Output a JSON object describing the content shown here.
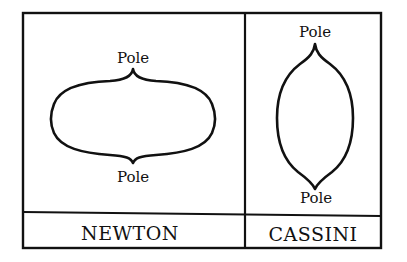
{
  "diagram": {
    "colors": {
      "ink": "#111111",
      "background": "#ffffff"
    },
    "panels": [
      {
        "name": "newton",
        "caption": "NEWTON",
        "shape": "oblate",
        "top_label": "Pole",
        "bottom_label": "Pole"
      },
      {
        "name": "cassini",
        "caption": "CASSINI",
        "shape": "prolate",
        "top_label": "Pole",
        "bottom_label": "Pole"
      }
    ]
  }
}
